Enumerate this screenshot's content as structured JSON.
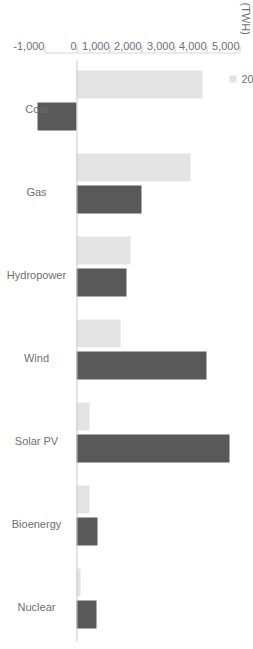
{
  "chart_data": {
    "type": "bar",
    "orientation": "horizontal",
    "title": "",
    "xlabel": "",
    "ylabel": "(TWH)",
    "unit_label": "(TWH)",
    "categories": [
      "Coal",
      "Gas",
      "Hydropower",
      "Wind",
      "Solar PV",
      "Bioenergy",
      "Nuclear"
    ],
    "series": [
      {
        "name": "2000~2019",
        "color": "#e3e3e3",
        "values": [
          3850,
          3500,
          1650,
          1350,
          400,
          390,
          120
        ]
      },
      {
        "name": "2019~2040",
        "color": "#595959",
        "values": [
          -1200,
          2000,
          1520,
          4000,
          4700,
          640,
          600
        ]
      }
    ],
    "axis": {
      "ticks": [
        5000,
        4000,
        3000,
        2000,
        1000,
        0,
        -1000
      ],
      "tick_labels": [
        "5,000",
        "4,000",
        "3,000",
        "2,000",
        "1,000",
        "0",
        "-1,000"
      ],
      "min": -1000,
      "max": 5000,
      "grid": false
    },
    "legend": {
      "position": "top-left",
      "entries": [
        {
          "label": "2000~2019",
          "color": "#e3e3e3"
        },
        {
          "label": "2019~2040",
          "color": "#595959"
        }
      ]
    }
  },
  "colors": {
    "series_light": "#e3e3e3",
    "series_dark": "#595959",
    "axis": "#c9c9c9",
    "text": "#6f6f6f",
    "background": "#ffffff"
  }
}
